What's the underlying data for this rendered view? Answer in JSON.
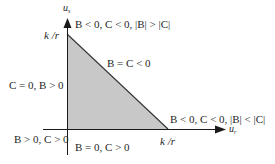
{
  "diagram": {
    "axes": {
      "x_label": {
        "base": "u",
        "sub": "r"
      },
      "y_label": {
        "base": "u",
        "sub": "s"
      }
    },
    "ticks": {
      "x_tick": "k /r",
      "y_tick": "k /r"
    },
    "region": {
      "shape": "triangle",
      "vertices": [
        "origin",
        "(k/r, 0)",
        "(0, k/r)"
      ],
      "fill": "#c8c8c8",
      "stroke": "#333333"
    },
    "annotations": {
      "top_vertex": "B < 0, C < 0, |B| > |C|",
      "hypotenuse": "B = C < 0",
      "left_edge": "C = 0, B > 0",
      "right_vertex": "B < 0, C < 0, |B| < |C|",
      "origin": "B > 0, C > 0",
      "bottom_edge": "B = 0, C > 0"
    },
    "colors": {
      "axis": "#1a1a1a",
      "region_fill": "#c8c8c8",
      "text": "#1f1f1f"
    }
  }
}
